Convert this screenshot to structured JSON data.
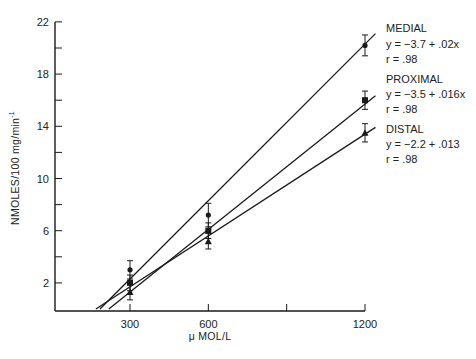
{
  "chart_data": {
    "type": "line",
    "title": "",
    "xlabel": "μ MOL/L",
    "ylabel": "NMOLES/100 mg/min⁻¹",
    "xlim": [
      0,
      1200
    ],
    "ylim": [
      0,
      22
    ],
    "x_ticks": [
      300,
      600,
      900,
      1200
    ],
    "x_tick_labels": [
      "300",
      "600",
      "",
      "1200"
    ],
    "y_ticks": [
      2,
      4,
      6,
      8,
      10,
      12,
      14,
      16,
      18,
      20,
      22
    ],
    "y_tick_labels": [
      "2",
      "",
      "6",
      "",
      "10",
      "",
      "14",
      "",
      "18",
      "",
      "22"
    ],
    "grid": false,
    "legend_position": "right",
    "series": [
      {
        "name": "MEDIAL",
        "marker": "circle",
        "equation": "y = −3.7 + .02x",
        "r": "r = .98",
        "x": [
          300,
          600,
          1200
        ],
        "values": [
          3.0,
          7.2,
          20.2
        ],
        "errors": [
          0.7,
          0.9,
          0.8
        ],
        "fit": {
          "intercept": -3.7,
          "slope": 0.02
        }
      },
      {
        "name": "PROXIMAL",
        "marker": "square",
        "equation": "y = −3.5 + .016x",
        "r": "r = .98",
        "x": [
          300,
          600,
          1200
        ],
        "values": [
          2.0,
          6.0,
          16.0
        ],
        "errors": [
          0.6,
          0.6,
          0.7
        ],
        "fit": {
          "intercept": -3.5,
          "slope": 0.016
        }
      },
      {
        "name": "DISTAL",
        "marker": "triangle",
        "equation": "y = −2.2 + .013",
        "r": "r = .98",
        "x": [
          300,
          600,
          1200
        ],
        "values": [
          1.3,
          5.2,
          13.5
        ],
        "errors": [
          0.6,
          0.6,
          0.7
        ],
        "fit": {
          "intercept": -2.2,
          "slope": 0.013
        }
      }
    ]
  },
  "axes": {
    "x_title": "μ MOL/L",
    "y_title": "NMOLES/100 mg/min",
    "y_title_sup": "-1"
  },
  "legend": {
    "medial": {
      "name": "MEDIAL",
      "equation": "y = −3.7 + .02x",
      "r": "r = .98"
    },
    "proximal": {
      "name": "PROXIMAL",
      "equation": "y = −3.5 + .016x",
      "r": "r = .98"
    },
    "distal": {
      "name": "DISTAL",
      "equation": "y = −2.2 + .013",
      "r": "r = .98"
    }
  }
}
